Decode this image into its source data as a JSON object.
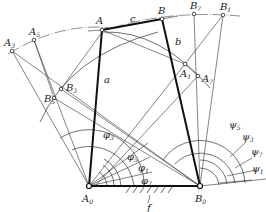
{
  "diagram": {
    "type": "mechanism-diagram",
    "points": {
      "A": {
        "label": "A",
        "sub": "",
        "x": 102,
        "y": 30
      },
      "B": {
        "label": "B",
        "sub": "",
        "x": 162,
        "y": 19
      },
      "A3": {
        "label": "A",
        "sub": "3",
        "x": 12,
        "y": 51
      },
      "A5": {
        "label": "A",
        "sub": "5",
        "x": 34,
        "y": 40
      },
      "B7": {
        "label": "B",
        "sub": "7",
        "x": 194,
        "y": 14
      },
      "B1": {
        "label": "B",
        "sub": "1",
        "x": 223,
        "y": 15
      },
      "B3": {
        "label": "B",
        "sub": "3",
        "x": 61,
        "y": 89
      },
      "B5": {
        "label": "B",
        "sub": "5",
        "x": 54,
        "y": 98
      },
      "A1": {
        "label": "A",
        "sub": "1",
        "x": 185,
        "y": 64
      },
      "A7": {
        "label": "A",
        "sub": "7",
        "x": 198,
        "y": 76
      },
      "A0": {
        "label": "A",
        "sub": "0",
        "x": 89,
        "y": 186
      },
      "B0": {
        "label": "B",
        "sub": "0",
        "x": 200,
        "y": 186
      }
    },
    "links": {
      "a": "a",
      "b": "b",
      "c": "c",
      "f": "f"
    },
    "angles_input": [
      {
        "symbol": "φ",
        "sub": "3"
      },
      {
        "symbol": "φ",
        "sub": "5"
      },
      {
        "symbol": "φ",
        "sub": "1"
      },
      {
        "symbol": "φ",
        "sub": "7"
      }
    ],
    "angles_output": [
      {
        "symbol": "ψ",
        "sub": "5"
      },
      {
        "symbol": "ψ",
        "sub": "3"
      },
      {
        "symbol": "ψ",
        "sub": "7"
      },
      {
        "symbol": "ψ",
        "sub": "1"
      }
    ],
    "colors": {
      "line": "#333333",
      "link": "#111111",
      "background": "#ffffff"
    }
  }
}
